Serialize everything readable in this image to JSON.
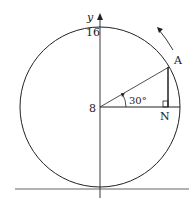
{
  "diagram": {
    "type": "geometry",
    "labels": {
      "y_axis": "y",
      "top_value": "16",
      "center_value": "8",
      "point_a": "A",
      "point_n": "N",
      "angle": "30°"
    },
    "colors": {
      "stroke": "#222222",
      "background": "#ffffff",
      "ground": "#555555"
    },
    "geometry": {
      "center": [
        100,
        107
      ],
      "radius": 80,
      "angle_deg": 30,
      "point_a": [
        169,
        67
      ],
      "point_n": [
        169,
        107
      ]
    }
  }
}
